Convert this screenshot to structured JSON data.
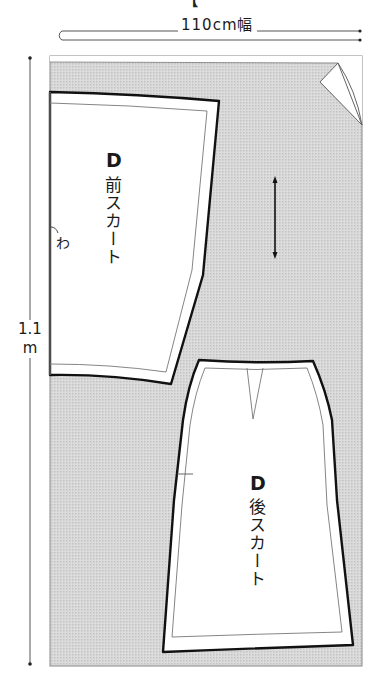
{
  "title_clipped": "【",
  "fabric": {
    "width_label": "110cm幅",
    "length_label_line1": "1.1",
    "length_label_line2": "m",
    "fill_color": "#d4d4d4",
    "border_color": "#888888"
  },
  "pieces": [
    {
      "id": "front-skirt",
      "letter": "D",
      "name": "前スカート",
      "fold_mark": "わ"
    },
    {
      "id": "back-skirt",
      "letter": "D",
      "name": "後スカート"
    }
  ],
  "grainline": {
    "direction": "vertical"
  },
  "colors": {
    "cut_line": "#111111",
    "seam_line": "#777777",
    "piece_fill": "#ffffff"
  }
}
